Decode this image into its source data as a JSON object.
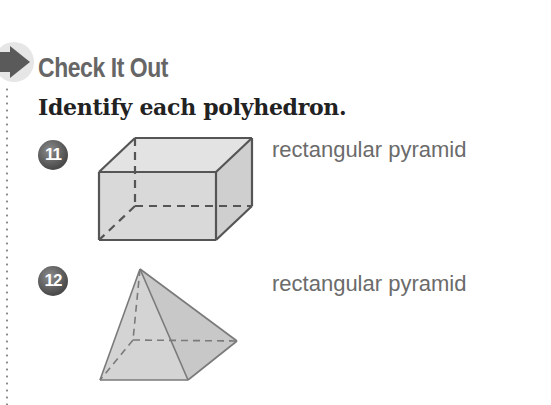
{
  "header": {
    "title": "Check It Out",
    "instruction": "Identify each polyhedron.",
    "arrow_icon": "right-arrow-icon"
  },
  "problems": [
    {
      "number": "11",
      "figure": "rectangular-prism",
      "answer": "rectangular pyramid"
    },
    {
      "number": "12",
      "figure": "rectangular-pyramid",
      "answer": "rectangular pyramid"
    }
  ],
  "colors": {
    "title": "#666666",
    "instruction": "#222222",
    "answer": "#6b6b6b",
    "badge": "#555555",
    "figure_fill": "#d6d6d6",
    "figure_stroke": "#555555"
  }
}
